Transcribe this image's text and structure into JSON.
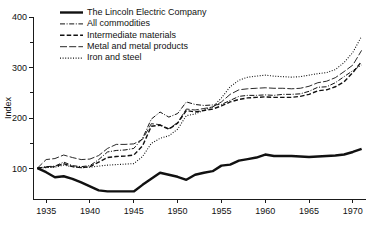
{
  "chart_data": {
    "type": "line",
    "title": "",
    "subtitle": "",
    "xlabel": "",
    "ylabel": "Index",
    "xlim": [
      1933.5,
      1971.5
    ],
    "ylim": [
      40,
      400
    ],
    "grid": false,
    "legend_position": "top-left",
    "x_ticks": [
      1935,
      1940,
      1945,
      1950,
      1955,
      1960,
      1965,
      1970
    ],
    "x_tick_labels": [
      "1935",
      "1940",
      "1945",
      "1950",
      "1955",
      "1960",
      "1965",
      "1970"
    ],
    "y_ticks_major": [
      100,
      200,
      300,
      400
    ],
    "y_tick_labels": [
      "100",
      "200",
      "300",
      "400"
    ],
    "y_ticks_minor": [
      150,
      250,
      350
    ],
    "series": [
      {
        "name": "The Lincoln Electric Company",
        "style": "solid-thick",
        "x": [
          1934,
          1935,
          1936,
          1937,
          1938,
          1939,
          1940,
          1941,
          1942,
          1943,
          1944,
          1945,
          1946,
          1947,
          1948,
          1949,
          1950,
          1951,
          1952,
          1953,
          1954,
          1955,
          1956,
          1957,
          1958,
          1959,
          1960,
          1961,
          1962,
          1963,
          1964,
          1965,
          1966,
          1967,
          1968,
          1969,
          1970,
          1971
        ],
        "values": [
          101,
          93,
          83,
          85,
          80,
          73,
          65,
          57,
          55,
          55,
          55,
          55,
          68,
          80,
          92,
          88,
          84,
          78,
          88,
          92,
          95,
          106,
          108,
          116,
          119,
          122,
          128,
          125,
          125,
          125,
          124,
          123,
          124,
          125,
          126,
          128,
          133,
          139
        ]
      },
      {
        "name": "All commodities",
        "style": "dash-dot",
        "x": [
          1934,
          1935,
          1936,
          1937,
          1938,
          1939,
          1940,
          1941,
          1942,
          1943,
          1944,
          1945,
          1946,
          1947,
          1948,
          1949,
          1950,
          1951,
          1952,
          1953,
          1954,
          1955,
          1956,
          1957,
          1958,
          1959,
          1960,
          1961,
          1962,
          1963,
          1964,
          1965,
          1966,
          1967,
          1968,
          1969,
          1970,
          1971
        ],
        "values": [
          101,
          104,
          105,
          113,
          106,
          104,
          106,
          118,
          133,
          136,
          137,
          140,
          160,
          198,
          212,
          202,
          209,
          232,
          227,
          225,
          226,
          227,
          235,
          243,
          245,
          245,
          246,
          245,
          247,
          247,
          248,
          253,
          261,
          262,
          270,
          282,
          294,
          305
        ]
      },
      {
        "name": "Intermediate materials",
        "style": "dashed",
        "x": [
          1934,
          1935,
          1936,
          1937,
          1938,
          1939,
          1940,
          1941,
          1942,
          1943,
          1944,
          1945,
          1946,
          1947,
          1948,
          1949,
          1950,
          1951,
          1952,
          1953,
          1954,
          1955,
          1956,
          1957,
          1958,
          1959,
          1960,
          1961,
          1962,
          1963,
          1964,
          1965,
          1966,
          1967,
          1968,
          1969,
          1970,
          1971
        ],
        "values": [
          101,
          103,
          104,
          110,
          104,
          102,
          104,
          113,
          122,
          124,
          125,
          127,
          145,
          184,
          186,
          178,
          190,
          215,
          212,
          215,
          218,
          224,
          232,
          237,
          240,
          241,
          242,
          241,
          241,
          241,
          243,
          247,
          254,
          256,
          262,
          272,
          290,
          312
        ]
      },
      {
        "name": "Metal and metal products",
        "style": "long-dash",
        "x": [
          1934,
          1935,
          1936,
          1937,
          1938,
          1939,
          1940,
          1941,
          1942,
          1943,
          1944,
          1945,
          1946,
          1947,
          1948,
          1949,
          1950,
          1951,
          1952,
          1953,
          1954,
          1955,
          1956,
          1957,
          1958,
          1959,
          1960,
          1961,
          1962,
          1963,
          1964,
          1965,
          1966,
          1967,
          1968,
          1969,
          1970,
          1971
        ],
        "values": [
          101,
          118,
          120,
          127,
          122,
          118,
          119,
          126,
          140,
          148,
          148,
          149,
          158,
          189,
          187,
          179,
          191,
          218,
          216,
          219,
          222,
          232,
          247,
          256,
          258,
          259,
          260,
          259,
          259,
          258,
          259,
          263,
          270,
          273,
          280,
          292,
          305,
          334
        ]
      },
      {
        "name": "Iron and steel",
        "style": "dotted",
        "x": [
          1934,
          1935,
          1936,
          1937,
          1938,
          1939,
          1940,
          1941,
          1942,
          1943,
          1944,
          1945,
          1946,
          1947,
          1948,
          1949,
          1950,
          1951,
          1952,
          1953,
          1954,
          1955,
          1956,
          1957,
          1958,
          1959,
          1960,
          1961,
          1962,
          1963,
          1964,
          1965,
          1966,
          1967,
          1968,
          1969,
          1970,
          1971
        ],
        "values": [
          101,
          102,
          103,
          107,
          104,
          102,
          103,
          105,
          107,
          108,
          109,
          110,
          124,
          150,
          160,
          165,
          178,
          205,
          208,
          216,
          222,
          240,
          262,
          275,
          281,
          283,
          285,
          283,
          282,
          281,
          282,
          285,
          288,
          290,
          296,
          310,
          330,
          362
        ]
      }
    ]
  },
  "legend": {
    "items": [
      {
        "label": "The Lincoln Electric Company",
        "style": "solid-thick"
      },
      {
        "label": "All commodities",
        "style": "dash-dot"
      },
      {
        "label": "Intermediate materials",
        "style": "dashed"
      },
      {
        "label": "Metal and metal products",
        "style": "long-dash"
      },
      {
        "label": "Iron and steel",
        "style": "dotted"
      }
    ]
  },
  "colors": {
    "ink": "#111111",
    "background": "#ffffff"
  }
}
